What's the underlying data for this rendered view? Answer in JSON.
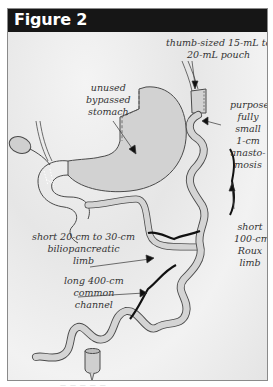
{
  "figure": {
    "title": "Figure 2",
    "header_color": "#161616",
    "footer_text": "— — — — —"
  },
  "labels": {
    "pouch": [
      "thumb-sized 15-mL to",
      "20-mL pouch"
    ],
    "stomach": [
      "unused",
      "bypassed",
      "stomach"
    ],
    "anastomosis": [
      "purpose-",
      "fully",
      "small",
      "1-cm",
      "anasto-",
      "mosis"
    ],
    "roux": [
      "short",
      "100-cm",
      "Roux",
      "limb"
    ],
    "biliopancreatic": [
      "short  20-cm to 30-cm",
      "biliopancreatic",
      "limb"
    ],
    "common": [
      "long 400-cm",
      "common",
      "channel"
    ]
  },
  "colors": {
    "organ_fill": "#cfcfcf",
    "organ_stroke": "#4a4a4a",
    "bracket": "#111111",
    "text": "#333333"
  }
}
